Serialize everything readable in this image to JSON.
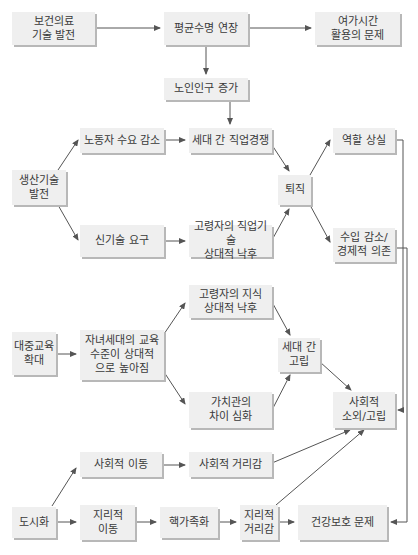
{
  "diagram": {
    "type": "flowchart",
    "colors": {
      "box_fill": "#efefef",
      "box_shadow": "#b8b8b8",
      "line": "#555555",
      "text": "#3a3a3a"
    },
    "nodes": [
      {
        "id": "n1",
        "label": "보건의료\n기술 발전",
        "x": 12,
        "y": 12,
        "w": 83,
        "h": 33
      },
      {
        "id": "n2",
        "label": "평균수명 연장",
        "x": 164,
        "y": 12,
        "w": 84,
        "h": 33
      },
      {
        "id": "n3",
        "label": "여가시간\n활용의 문제",
        "x": 315,
        "y": 12,
        "w": 85,
        "h": 33
      },
      {
        "id": "n4",
        "label": "노인인구 증가",
        "x": 164,
        "y": 78,
        "w": 84,
        "h": 22
      },
      {
        "id": "n5",
        "label": "노동자 수요 감소",
        "x": 80,
        "y": 128,
        "w": 84,
        "h": 25
      },
      {
        "id": "n6",
        "label": "세대 간 직업경쟁",
        "x": 189,
        "y": 128,
        "w": 83,
        "h": 25
      },
      {
        "id": "n7",
        "label": "역할 상실",
        "x": 333,
        "y": 128,
        "w": 62,
        "h": 25
      },
      {
        "id": "n8",
        "label": "생산기술\n발전",
        "x": 12,
        "y": 170,
        "w": 54,
        "h": 35
      },
      {
        "id": "n9",
        "label": "퇴직",
        "x": 278,
        "y": 175,
        "w": 33,
        "h": 30
      },
      {
        "id": "n10",
        "label": "신기술 요구",
        "x": 80,
        "y": 225,
        "w": 84,
        "h": 32
      },
      {
        "id": "n11",
        "label": "고령자의 직업기술\n상대적 낙후",
        "x": 189,
        "y": 225,
        "w": 83,
        "h": 32
      },
      {
        "id": "n12",
        "label": "수입 감소/\n경제적 의존",
        "x": 333,
        "y": 228,
        "w": 62,
        "h": 34
      },
      {
        "id": "n13",
        "label": "고령자의 지식\n상대적 낙후",
        "x": 189,
        "y": 285,
        "w": 83,
        "h": 33
      },
      {
        "id": "n14",
        "label": "대중교육\n확대",
        "x": 12,
        "y": 332,
        "w": 44,
        "h": 43
      },
      {
        "id": "n15",
        "label": "자녀세대의 교육\n수준이 상대적\n으로 높아짐",
        "x": 80,
        "y": 330,
        "w": 84,
        "h": 50
      },
      {
        "id": "n16",
        "label": "세대 간\n고립",
        "x": 278,
        "y": 338,
        "w": 42,
        "h": 34
      },
      {
        "id": "n17",
        "label": "가치관의\n차이 심화",
        "x": 189,
        "y": 392,
        "w": 83,
        "h": 36
      },
      {
        "id": "n18",
        "label": "사회적\n소외/고립",
        "x": 333,
        "y": 392,
        "w": 62,
        "h": 36
      },
      {
        "id": "n19",
        "label": "사회적 이동",
        "x": 80,
        "y": 452,
        "w": 82,
        "h": 25
      },
      {
        "id": "n20",
        "label": "사회적 거리감",
        "x": 189,
        "y": 452,
        "w": 83,
        "h": 25
      },
      {
        "id": "n21",
        "label": "도시화",
        "x": 12,
        "y": 507,
        "w": 44,
        "h": 31
      },
      {
        "id": "n22",
        "label": "지리적\n이동",
        "x": 80,
        "y": 505,
        "w": 55,
        "h": 35
      },
      {
        "id": "n23",
        "label": "핵가족화",
        "x": 160,
        "y": 507,
        "w": 58,
        "h": 31
      },
      {
        "id": "n24",
        "label": "지리적\n거리감",
        "x": 240,
        "y": 505,
        "w": 38,
        "h": 35
      },
      {
        "id": "n25",
        "label": "건강보호 문제",
        "x": 298,
        "y": 505,
        "w": 89,
        "h": 35
      }
    ],
    "edges": [
      {
        "from": "보건의료 기술 발전",
        "to": "평균수명 연장",
        "points": [
          [
            95,
            28
          ],
          [
            160,
            28
          ]
        ]
      },
      {
        "from": "평균수명 연장",
        "to": "여가시간 활용의 문제",
        "points": [
          [
            248,
            28
          ],
          [
            311,
            28
          ]
        ]
      },
      {
        "from": "평균수명 연장",
        "to": "노인인구 증가",
        "points": [
          [
            206,
            45
          ],
          [
            206,
            74
          ]
        ]
      },
      {
        "from": "노인인구 증가",
        "to": "세대 간 직업경쟁",
        "points": [
          [
            230,
            100
          ],
          [
            230,
            124
          ]
        ]
      },
      {
        "from": "생산기술 발전",
        "to": "노동자 수요 감소",
        "points": [
          [
            58,
            170
          ],
          [
            78,
            140
          ]
        ]
      },
      {
        "from": "생산기술 발전",
        "to": "신기술 요구",
        "points": [
          [
            58,
            205
          ],
          [
            78,
            240
          ]
        ]
      },
      {
        "from": "노동자 수요 감소",
        "to": "세대 간 직업경쟁",
        "points": [
          [
            164,
            140
          ],
          [
            185,
            140
          ]
        ]
      },
      {
        "from": "신기술 요구",
        "to": "고령자의 직업기술 상대적 낙후",
        "points": [
          [
            164,
            241
          ],
          [
            185,
            241
          ]
        ]
      },
      {
        "from": "세대 간 직업경쟁",
        "to": "퇴직",
        "points": [
          [
            272,
            145
          ],
          [
            289,
            171
          ]
        ]
      },
      {
        "from": "고령자의 직업기술 상대적 낙후",
        "to": "퇴직",
        "points": [
          [
            272,
            240
          ],
          [
            289,
            209
          ]
        ]
      },
      {
        "from": "퇴직",
        "to": "역할 상실",
        "points": [
          [
            310,
            175
          ],
          [
            330,
            140
          ]
        ]
      },
      {
        "from": "퇴직",
        "to": "수입 감소/경제적 의존",
        "points": [
          [
            310,
            205
          ],
          [
            330,
            242
          ]
        ]
      },
      {
        "from": "역할 상실",
        "to": "사회적 소외/고립",
        "points": [
          [
            395,
            140
          ],
          [
            403,
            140
          ],
          [
            403,
            410
          ],
          [
            398,
            410
          ]
        ]
      },
      {
        "from": "수입 감소/경제적 의존",
        "to": "건강보호 문제",
        "points": [
          [
            395,
            248
          ],
          [
            407,
            248
          ],
          [
            407,
            522
          ],
          [
            391,
            522
          ]
        ]
      },
      {
        "from": "대중교육 확대",
        "to": "자녀세대의 교육 수준이 상대적으로 높아짐",
        "points": [
          [
            56,
            354
          ],
          [
            76,
            354
          ]
        ]
      },
      {
        "from": "자녀세대의 교육 수준이 상대적으로 높아짐",
        "to": "고령자의 지식 상대적 낙후",
        "points": [
          [
            164,
            334
          ],
          [
            185,
            303
          ]
        ]
      },
      {
        "from": "자녀세대의 교육 수준이 상대적으로 높아짐",
        "to": "가치관의 차이 심화",
        "points": [
          [
            164,
            372
          ],
          [
            185,
            404
          ]
        ]
      },
      {
        "from": "고령자의 지식 상대적 낙후",
        "to": "세대 간 고립",
        "points": [
          [
            272,
            302
          ],
          [
            290,
            335
          ]
        ]
      },
      {
        "from": "가치관의 차이 심화",
        "to": "세대 간 고립",
        "points": [
          [
            272,
            410
          ],
          [
            290,
            375
          ]
        ]
      },
      {
        "from": "세대 간 고립",
        "to": "사회적 소외/고립",
        "points": [
          [
            320,
            362
          ],
          [
            351,
            390
          ]
        ]
      },
      {
        "from": "도시화",
        "to": "사회적 이동",
        "points": [
          [
            52,
            506
          ],
          [
            76,
            468
          ]
        ]
      },
      {
        "from": "도시화",
        "to": "지리적 이동",
        "points": [
          [
            56,
            522
          ],
          [
            76,
            522
          ]
        ]
      },
      {
        "from": "사회적 이동",
        "to": "사회적 거리감",
        "points": [
          [
            162,
            465
          ],
          [
            185,
            465
          ]
        ]
      },
      {
        "from": "지리적 이동",
        "to": "핵가족화",
        "points": [
          [
            135,
            522
          ],
          [
            156,
            522
          ]
        ]
      },
      {
        "from": "핵가족화",
        "to": "지리적 거리감",
        "points": [
          [
            218,
            522
          ],
          [
            236,
            522
          ]
        ]
      },
      {
        "from": "지리적 거리감",
        "to": "건강보호 문제",
        "points": [
          [
            278,
            522
          ],
          [
            294,
            522
          ]
        ]
      },
      {
        "from": "사회적 거리감",
        "to": "사회적 소외/고립",
        "points": [
          [
            272,
            463
          ],
          [
            350,
            430
          ]
        ]
      },
      {
        "from": "지리적 거리감",
        "to": "사회적 소외/고립",
        "points": [
          [
            276,
            505
          ],
          [
            364,
            430
          ]
        ]
      }
    ]
  }
}
